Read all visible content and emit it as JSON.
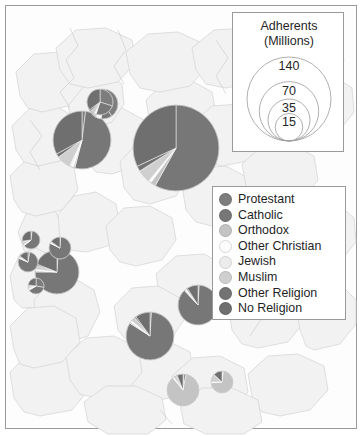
{
  "figure": {
    "type": "proportional-symbol-map",
    "region": "Europe",
    "background_color": "#fdfdfd",
    "border_color": "#9a9a9a",
    "country_fill": "#f2f2f2",
    "country_stroke": "#d0d0d0"
  },
  "size_legend": {
    "title_line1": "Adherents",
    "title_line2": "(Millions)",
    "unit": "millions",
    "circles": [
      {
        "label": "140",
        "value": 140,
        "r": 42
      },
      {
        "label": "70",
        "value": 70,
        "r": 29.7
      },
      {
        "label": "35",
        "value": 35,
        "r": 21
      },
      {
        "label": "15",
        "value": 15,
        "r": 13.8
      }
    ]
  },
  "category_legend": {
    "items": [
      {
        "label": "Protestant",
        "color": "#7d7d7d"
      },
      {
        "label": "Catholic",
        "color": "#777777"
      },
      {
        "label": "Orthodox",
        "color": "#c4c4c4"
      },
      {
        "label": "Other Christian",
        "color": "#fcfcfc"
      },
      {
        "label": "Jewish",
        "color": "#ececec"
      },
      {
        "label": "Muslim",
        "color": "#cfcfcf"
      },
      {
        "label": "Other Religion",
        "color": "#737373"
      },
      {
        "label": "No Religion",
        "color": "#6f6f6f"
      }
    ]
  },
  "chart_data": {
    "type": "pie",
    "title": "Adherents (Millions)",
    "categories": [
      "Protestant",
      "Catholic",
      "Orthodox",
      "Other Christian",
      "Jewish",
      "Muslim",
      "Other Religion",
      "No Religion"
    ],
    "colors": [
      "#7d7d7d",
      "#777777",
      "#c4c4c4",
      "#fcfcfc",
      "#ececec",
      "#cfcfcf",
      "#737373",
      "#6f6f6f"
    ],
    "legend_position": "right",
    "grid": false,
    "pies": [
      {
        "name": "germany",
        "cx": 176,
        "cy": 148,
        "r": 43,
        "total": 82,
        "values": [
          0,
          58,
          2,
          1,
          0,
          5,
          2,
          32
        ]
      },
      {
        "name": "france",
        "cx": 82,
        "cy": 140,
        "r": 29,
        "total": 54,
        "values": [
          2,
          52,
          1,
          1,
          1,
          8,
          2,
          33
        ]
      },
      {
        "name": "united-kingdom",
        "cx": 103,
        "cy": 104,
        "r": 15,
        "total": 18,
        "values": [
          40,
          12,
          1,
          4,
          1,
          5,
          2,
          35
        ]
      },
      {
        "name": "netherlands",
        "cx": 100,
        "cy": 102,
        "r": 13,
        "total": 15,
        "values": [
          30,
          25,
          0,
          2,
          0,
          6,
          2,
          35
        ]
      },
      {
        "name": "spain",
        "cx": 57,
        "cy": 272,
        "r": 22,
        "total": 39,
        "values": [
          1,
          74,
          1,
          1,
          0,
          3,
          1,
          19
        ]
      },
      {
        "name": "portugal",
        "cx": 60,
        "cy": 248,
        "r": 11,
        "total": 9,
        "values": [
          1,
          81,
          0,
          1,
          0,
          1,
          1,
          15
        ]
      },
      {
        "name": "italy",
        "cx": 150,
        "cy": 336,
        "r": 24,
        "total": 50,
        "values": [
          1,
          83,
          1,
          1,
          0,
          3,
          1,
          10
        ]
      },
      {
        "name": "poland",
        "cx": 198,
        "cy": 305,
        "r": 20,
        "total": 33,
        "values": [
          1,
          87,
          1,
          1,
          0,
          0,
          1,
          9
        ]
      },
      {
        "name": "ireland",
        "cx": 28,
        "cy": 262,
        "r": 10,
        "total": 7,
        "values": [
          3,
          78,
          1,
          1,
          0,
          1,
          1,
          15
        ]
      },
      {
        "name": "belgium",
        "cx": 31,
        "cy": 240,
        "r": 9,
        "total": 6,
        "values": [
          2,
          62,
          1,
          1,
          0,
          6,
          1,
          27
        ]
      },
      {
        "name": "greece",
        "cx": 183,
        "cy": 390,
        "r": 16,
        "total": 10,
        "values": [
          1,
          2,
          86,
          1,
          0,
          3,
          1,
          6
        ]
      },
      {
        "name": "bulgaria",
        "cx": 222,
        "cy": 382,
        "r": 11,
        "total": 6,
        "values": [
          1,
          1,
          72,
          1,
          0,
          11,
          1,
          13
        ]
      },
      {
        "name": "switzerland",
        "cx": 36,
        "cy": 286,
        "r": 8,
        "total": 5,
        "values": [
          28,
          38,
          2,
          2,
          0,
          5,
          2,
          23
        ]
      }
    ]
  }
}
